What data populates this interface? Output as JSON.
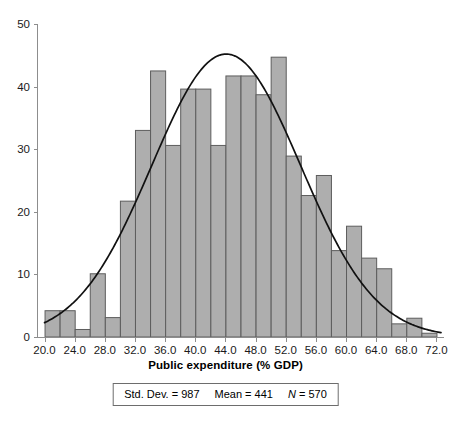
{
  "chart_data": {
    "type": "bar",
    "title": "",
    "xlabel": "Public expenditure (% GDP)",
    "ylabel": "",
    "xlim": [
      19.0,
      73.0
    ],
    "ylim": [
      0,
      50
    ],
    "grid": false,
    "legend_position": "below",
    "bin_width": 2,
    "categories": [
      "20",
      "22",
      "24",
      "26",
      "28",
      "30",
      "32",
      "34",
      "36",
      "38",
      "40",
      "42",
      "44",
      "46",
      "48",
      "50",
      "52",
      "54",
      "56",
      "58",
      "60",
      "62",
      "64",
      "66",
      "68",
      "70"
    ],
    "bin_starts": [
      20,
      22,
      24,
      26,
      28,
      30,
      32,
      34,
      36,
      38,
      40,
      42,
      44,
      46,
      48,
      50,
      52,
      54,
      56,
      58,
      60,
      62,
      64,
      66,
      68,
      70
    ],
    "values": [
      4.2,
      4.2,
      1.2,
      10.1,
      3.1,
      21.7,
      33.0,
      42.5,
      30.6,
      39.6,
      39.6,
      30.6,
      41.7,
      41.7,
      38.7,
      44.7,
      28.9,
      22.6,
      25.8,
      13.8,
      17.7,
      12.6,
      10.9,
      2.1,
      3.0,
      0.6
    ],
    "xticks": [
      "20.0",
      "24.0",
      "28.0",
      "32.0",
      "36.0",
      "40.0",
      "44.0",
      "48.0",
      "52.0",
      "56.0",
      "60.0",
      "64.0",
      "68.0",
      "72.0"
    ],
    "xtick_values": [
      20,
      24,
      28,
      32,
      36,
      40,
      44,
      48,
      52,
      56,
      60,
      64,
      68,
      72
    ],
    "yticks": [
      "0",
      "10",
      "20",
      "30",
      "40",
      "50"
    ],
    "ytick_values": [
      0,
      10,
      20,
      30,
      40,
      50
    ],
    "overlay_curve": {
      "name": "normal-distribution-curve",
      "mean": 44.1,
      "std_dev": 9.87,
      "peak_value": 45.2,
      "color": "#111111"
    },
    "bar_color": "#aeaeae",
    "bar_edge_color": "#5d5d5d"
  },
  "stats_box": {
    "std_dev_label": "Std. Dev. = 987",
    "mean_label": "Mean = 441",
    "n_symbol": "N",
    "n_value": "= 570"
  }
}
